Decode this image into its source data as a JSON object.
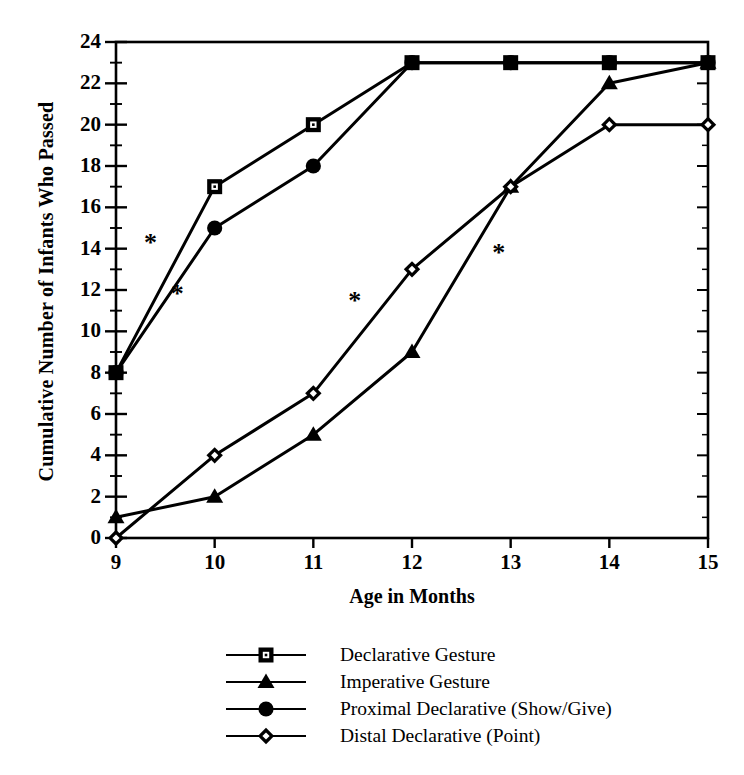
{
  "chart_data": {
    "type": "line",
    "title": "",
    "xlabel": "Age in Months",
    "ylabel": "Cumulative Number of Infants Who Passed",
    "x": [
      9,
      10,
      11,
      12,
      13,
      14,
      15
    ],
    "xlim": [
      9,
      15
    ],
    "ylim": [
      0,
      24
    ],
    "xticks": [
      "9",
      "10",
      "11",
      "12",
      "13",
      "14",
      "15"
    ],
    "yticks": [
      "0",
      "2",
      "4",
      "6",
      "8",
      "10",
      "12",
      "14",
      "16",
      "18",
      "20",
      "22",
      "24"
    ],
    "ytick_step": 2,
    "yminor_step": 1,
    "grid": false,
    "legend_position": "bottom",
    "series": [
      {
        "name": "Declarative Gesture",
        "marker": "open-square",
        "values": [
          8,
          17,
          20,
          23,
          23,
          23,
          23
        ]
      },
      {
        "name": "Imperative Gesture",
        "marker": "filled-triangle",
        "values": [
          1,
          2,
          5,
          9,
          17,
          22,
          23
        ]
      },
      {
        "name": "Proximal Declarative (Show/Give)",
        "marker": "filled-circle",
        "values": [
          8,
          15,
          18,
          23,
          23,
          23,
          23
        ]
      },
      {
        "name": "Distal Declarative (Point)",
        "marker": "open-diamond",
        "values": [
          0,
          4,
          7,
          13,
          17,
          20,
          20
        ]
      }
    ],
    "annotations": [
      {
        "text": "*",
        "x": 9.35,
        "y": 13.9
      },
      {
        "text": "*",
        "x": 9.62,
        "y": 11.4
      },
      {
        "text": "*",
        "x": 11.42,
        "y": 11.1
      },
      {
        "text": "*",
        "x": 12.88,
        "y": 13.4
      }
    ],
    "line_color": "#000000",
    "background_color": "#ffffff"
  },
  "legend": {
    "items": [
      {
        "label": "Declarative Gesture",
        "marker": "open-square"
      },
      {
        "label": "Imperative Gesture",
        "marker": "filled-triangle"
      },
      {
        "label": "Proximal Declarative (Show/Give)",
        "marker": "filled-circle"
      },
      {
        "label": "Distal Declarative (Point)",
        "marker": "open-diamond"
      }
    ]
  },
  "axis": {
    "x_title": "Age in Months",
    "y_title": "Cumulative Number of Infants Who Passed"
  }
}
